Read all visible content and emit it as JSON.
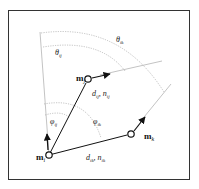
{
  "diagram": {
    "type": "geometric-relation",
    "colors": {
      "frame": "#333333",
      "edge": "#111111",
      "guide": "#9a9a9a",
      "background": "#ffffff"
    },
    "nodes": {
      "mi": {
        "label": "m",
        "sub": "i",
        "x": 49,
        "y": 155
      },
      "mj": {
        "label": "m",
        "sub": "j",
        "x": 88,
        "y": 79
      },
      "mk": {
        "label": "m",
        "sub": "k",
        "x": 131,
        "y": 134
      }
    },
    "edges": {
      "ij": {
        "label": "d",
        "sub": "ij",
        "label2": "n",
        "sub2": "ij"
      },
      "ik": {
        "label": "d",
        "sub": "ik",
        "label2": "n",
        "sub2": "ik"
      }
    },
    "angles": {
      "theta_ij": {
        "symbol": "θ",
        "sub": "ij"
      },
      "theta_ik": {
        "symbol": "θ",
        "sub": "ik"
      },
      "phi_ij": {
        "symbol": "φ",
        "sub": "ij"
      },
      "phi_ik": {
        "symbol": "φ",
        "sub": "ik"
      }
    },
    "separator": ","
  }
}
